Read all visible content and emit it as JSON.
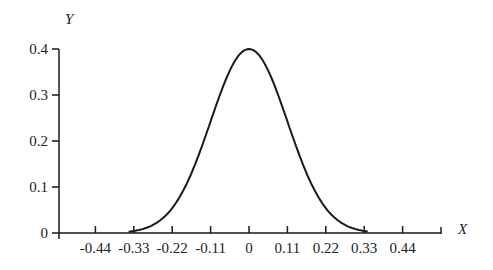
{
  "chart_data": {
    "type": "line",
    "title": "",
    "xlabel": "X",
    "ylabel": "Y",
    "x_ticks": [
      "-0.44",
      "-0.33",
      "-0.22",
      "-0.11",
      "0",
      "0.11",
      "0.22",
      "0.33",
      "0.44"
    ],
    "y_ticks": [
      "0",
      "0.1",
      "0.2",
      "0.3",
      "0.4"
    ],
    "xlim": [
      -0.55,
      0.55
    ],
    "ylim": [
      0,
      0.4
    ],
    "grid": false,
    "legend": null,
    "series": [
      {
        "name": "normal density",
        "x": [
          -0.33,
          -0.22,
          -0.11,
          0,
          0.11,
          0.22,
          0.33
        ],
        "values": [
          0.004,
          0.054,
          0.242,
          0.399,
          0.242,
          0.054,
          0.004
        ],
        "description": "Bell-shaped normal curve centered at 0, sigma ≈ 0.11"
      }
    ]
  }
}
